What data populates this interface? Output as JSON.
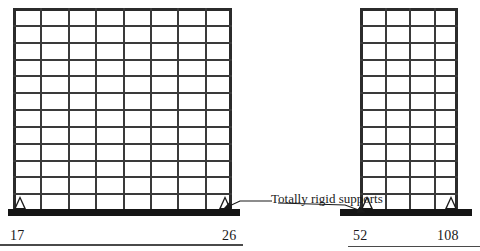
{
  "diagram": {
    "annotation": {
      "label": "Totally rigid supports",
      "arrow_count": 2
    },
    "colors": {
      "outline": "#2b2b2b",
      "member": "#3a3a3a",
      "ground": "#151515",
      "text": "#1a1a1a",
      "background": "#ffffff",
      "rule": "#4a4a4a"
    },
    "frames": [
      {
        "name": "left-frame",
        "bays": 8,
        "stories": 12,
        "x": 13,
        "y": 8,
        "width": 219,
        "height": 202,
        "supports": [
          {
            "name": "left-pin-support",
            "x": 20,
            "node": "17"
          },
          {
            "name": "right-pin-support",
            "x": 225,
            "node": "26"
          }
        ],
        "node_labels": [
          {
            "text": "17",
            "x": 10,
            "y": 228
          },
          {
            "text": "26",
            "x": 222,
            "y": 228
          }
        ],
        "ground": {
          "x": 8,
          "y": 209,
          "width": 232,
          "height": 7
        }
      },
      {
        "name": "right-frame",
        "bays": 4,
        "stories": 12,
        "x": 360,
        "y": 8,
        "width": 98,
        "height": 202,
        "supports": [
          {
            "name": "left-pin-support",
            "x": 367,
            "node": "52"
          },
          {
            "name": "right-pin-support",
            "x": 451,
            "node": "108"
          }
        ],
        "node_labels": [
          {
            "text": "52",
            "x": 353,
            "y": 228
          },
          {
            "text": "108",
            "x": 437,
            "y": 228
          }
        ],
        "ground": {
          "x": 340,
          "y": 209,
          "width": 132,
          "height": 7
        }
      }
    ],
    "rules": [
      {
        "name": "bottom-rule-left",
        "x": 0,
        "y": 244,
        "width": 243,
        "height": 2
      },
      {
        "name": "bottom-rule-right",
        "x": 348,
        "y": 246,
        "width": 132,
        "height": 1
      }
    ]
  }
}
